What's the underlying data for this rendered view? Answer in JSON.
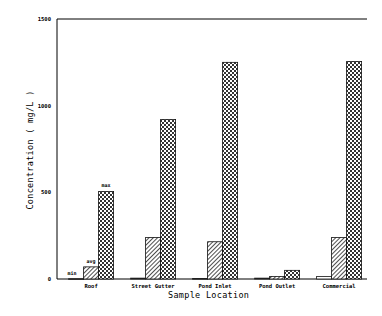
{
  "chart_data": {
    "type": "bar",
    "title": "",
    "xlabel": "Sample Location",
    "ylabel": "Concentration ( mg/L )",
    "ylim": [
      0,
      1500
    ],
    "yticks": [
      0,
      500,
      1000,
      1500
    ],
    "grid": false,
    "legend": "inline labels on first group (min, avg, max)",
    "categories": [
      "Roof",
      "Street Gutter",
      "Pond Inlet",
      "Pond Outlet",
      "Commercial"
    ],
    "series": [
      {
        "name": "min",
        "pattern": "none",
        "values": [
          2,
          5,
          3,
          5,
          15
        ]
      },
      {
        "name": "avg",
        "pattern": "diagonal-hatch",
        "values": [
          70,
          240,
          215,
          15,
          240
        ]
      },
      {
        "name": "max",
        "pattern": "crosshatch",
        "values": [
          505,
          920,
          1250,
          50,
          1255
        ]
      }
    ],
    "annotations": [
      "min",
      "avg",
      "max"
    ]
  }
}
